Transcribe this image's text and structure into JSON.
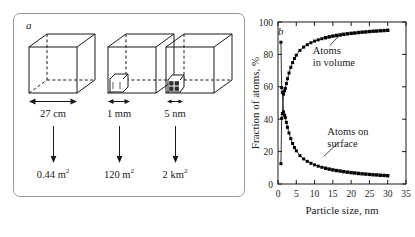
{
  "figure": {
    "panel_a": {
      "label": "a",
      "columns": [
        {
          "size": "27 cm",
          "area": "0.44 m",
          "area_exp": "2"
        },
        {
          "size": "1 mm",
          "area": "120 m",
          "area_exp": "2"
        },
        {
          "size": "5 nm",
          "area": "2 km",
          "area_exp": "2"
        }
      ]
    },
    "panel_b": {
      "label": "b"
    }
  },
  "chart_data": {
    "type": "line",
    "title": "",
    "xlabel": "Particle size, nm",
    "ylabel": "Fraction of atoms, %",
    "xlim": [
      0,
      35
    ],
    "ylim": [
      0,
      100
    ],
    "xticks": [
      0,
      5,
      10,
      15,
      20,
      25,
      30,
      35
    ],
    "yticks": [
      0,
      20,
      40,
      60,
      80,
      100
    ],
    "xtick_labels": [
      "0",
      "5",
      "10",
      "15",
      "20",
      "25",
      "30",
      "35"
    ],
    "ytick_labels": [
      "0",
      "20",
      "40",
      "60",
      "80",
      "100"
    ],
    "grid": false,
    "legend": "annotations",
    "marker": "square",
    "series": [
      {
        "name": "Atoms in volume",
        "annotation": "Atoms\nin volume",
        "annotation_line1": "Atoms",
        "annotation_line2": "in volume",
        "color": "#000000",
        "x": [
          0.8,
          1.0,
          1.2,
          1.5,
          1.8,
          2.0,
          2.3,
          2.6,
          3.0,
          3.5,
          4.0,
          4.5,
          5.0,
          6.0,
          7.0,
          8.0,
          9.0,
          10.0,
          11.0,
          12.0,
          13.0,
          14.0,
          15.0,
          16.0,
          17.0,
          18.0,
          19.0,
          20.0,
          21.0,
          22.0,
          23.0,
          24.0,
          25.0,
          26.0,
          27.0,
          28.0,
          29.0,
          30.0
        ],
        "y": [
          12.5,
          40.5,
          43.5,
          55.5,
          57.5,
          59.0,
          62.0,
          65.0,
          68.5,
          72.0,
          75.0,
          77.5,
          79.5,
          82.5,
          84.5,
          86.0,
          87.2,
          88.2,
          89.0,
          89.7,
          90.3,
          90.8,
          91.3,
          91.7,
          92.0,
          92.4,
          92.7,
          93.0,
          93.2,
          93.5,
          93.7,
          93.9,
          94.1,
          94.3,
          94.4,
          94.6,
          94.7,
          94.9
        ]
      },
      {
        "name": "Atoms on surface",
        "annotation": "Atoms on\nsurface",
        "annotation_line1": "Atoms on",
        "annotation_line2": "surface",
        "color": "#000000",
        "x": [
          0.8,
          1.0,
          1.2,
          1.5,
          1.8,
          2.0,
          2.3,
          2.6,
          3.0,
          3.5,
          4.0,
          4.5,
          5.0,
          6.0,
          7.0,
          8.0,
          9.0,
          10.0,
          11.0,
          12.0,
          13.0,
          14.0,
          15.0,
          16.0,
          17.0,
          18.0,
          19.0,
          20.0,
          21.0,
          22.0,
          23.0,
          24.0,
          25.0,
          26.0,
          27.0,
          28.0,
          29.0,
          30.0
        ],
        "y": [
          87.5,
          59.5,
          56.5,
          44.5,
          42.5,
          41.0,
          38.0,
          35.0,
          31.5,
          28.0,
          25.0,
          22.5,
          20.5,
          17.5,
          15.5,
          14.0,
          12.8,
          11.8,
          11.0,
          10.3,
          9.7,
          9.2,
          8.7,
          8.3,
          8.0,
          7.6,
          7.3,
          7.0,
          6.8,
          6.5,
          6.3,
          6.1,
          5.9,
          5.7,
          5.6,
          5.4,
          5.3,
          5.1
        ]
      }
    ]
  }
}
